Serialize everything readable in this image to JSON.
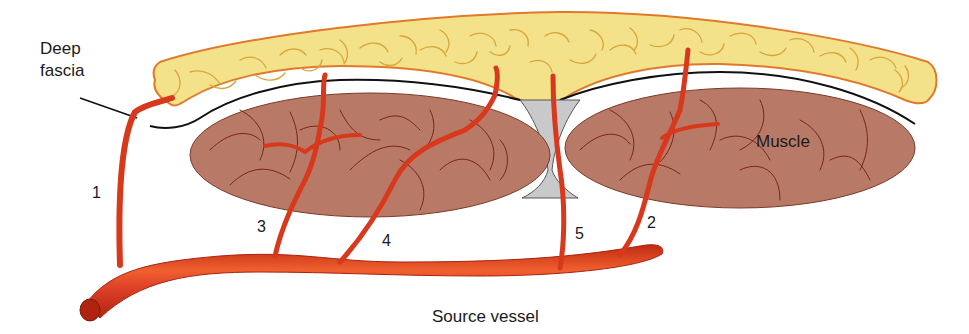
{
  "diagram": {
    "type": "anatomical-illustration",
    "labels": {
      "deep_fascia_line1": "Deep",
      "deep_fascia_line2": "fascia",
      "muscle": "Muscle",
      "source_vessel": "Source vessel"
    },
    "vessel_numbers": {
      "v1": "1",
      "v2": "2",
      "v3": "3",
      "v4": "4",
      "v5": "5"
    },
    "colors": {
      "fat_fill": "#f3e28a",
      "fat_outline": "#e07a2a",
      "fat_texture": "#d9a53a",
      "muscle_fill": "#b87a66",
      "muscle_fiber": "#7a2418",
      "vessel": "#d8381c",
      "vessel_dark": "#a82410",
      "vessel_highlight": "#f07a50",
      "septum_fill": "#c9c9cb",
      "fascia_line": "#111111"
    }
  }
}
